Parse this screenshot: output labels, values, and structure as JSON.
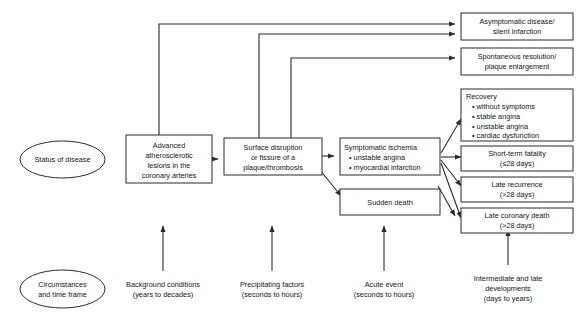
{
  "diagram": {
    "colors": {
      "stroke": "#2b2b2b",
      "text": "#141414",
      "background": "#ffffff"
    },
    "row_labels": {
      "status": "Status of disease",
      "circumstances_line1": "Circumstances",
      "circumstances_line2": "and time frame"
    },
    "nodes": {
      "advanced_lesions": {
        "line1": "Advanced",
        "line2": "atherosclerotic",
        "line3": "lesions in the",
        "line4": "coronary arteries"
      },
      "surface_disruption": {
        "line1": "Surface disruption",
        "line2": "or fissure of a",
        "line3": "plaque/thrombosis"
      },
      "symptomatic_ischemia": {
        "title": "Symptomatic ischemia",
        "bullet1": "• unstable angina",
        "bullet2": "• myocardial infarction"
      },
      "sudden_death": {
        "label": "Sudden death"
      },
      "asymptomatic": {
        "line1": "Asymptomatic disease/",
        "line2": "silent infarction"
      },
      "spontaneous": {
        "line1": "Spontaneous resolution/",
        "line2": "plaque enlargement"
      },
      "recovery": {
        "title": "Recovery",
        "bullet1": "• without symptoms",
        "bullet2": "• stable angina",
        "bullet3": "• unstable angina",
        "bullet4": "• cardiac dysfunction"
      },
      "short_term_fatality": {
        "line1": "Short-term fatality",
        "line2": "(≤28 days)"
      },
      "late_recurrence": {
        "line1": "Late recurrence",
        "line2": "(>28 days)"
      },
      "late_coronary_death": {
        "line1": "Late coronary death",
        "line2": "(>28 days)"
      }
    },
    "timeframes": {
      "background": {
        "line1": "Background conditions",
        "line2": "(years to decades)"
      },
      "precipitating": {
        "line1": "Precipitating factors",
        "line2": "(seconds to hours)"
      },
      "acute": {
        "line1": "Acute event",
        "line2": "(seconds to hours)"
      },
      "intermediate": {
        "line1": "Intermediate and late",
        "line2": "developments",
        "line3": "(days to years)"
      }
    }
  }
}
